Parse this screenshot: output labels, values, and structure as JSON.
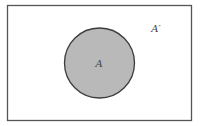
{
  "diagram": {
    "type": "venn",
    "universe": {
      "label": "A′"
    },
    "sets": [
      {
        "label": "A",
        "shaded": true
      }
    ],
    "colors": {
      "background": "#ffffff",
      "border": "#555555",
      "set_fill": "#b9b9b9",
      "set_stroke": "#3c3c3c",
      "text": "#444444"
    }
  }
}
